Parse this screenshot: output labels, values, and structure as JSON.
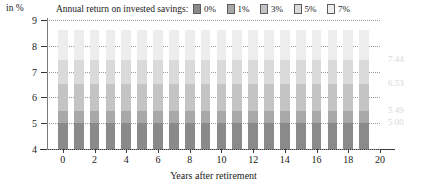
{
  "chart_data": {
    "type": "bar",
    "stacked": true,
    "title": "",
    "xlabel": "Years after retirement",
    "ylabel": "in %",
    "xlim": [
      -1,
      20
    ],
    "ylim": [
      4,
      9
    ],
    "grid": true,
    "legend_position": "top",
    "legend_title": "Annual return on invested savings:",
    "xticks": [
      0,
      2,
      4,
      6,
      8,
      10,
      12,
      14,
      16,
      18,
      20
    ],
    "yticks": [
      4,
      5,
      6,
      7,
      8,
      9
    ],
    "categories": [
      0,
      1,
      2,
      3,
      4,
      5,
      6,
      7,
      8,
      9,
      10,
      11,
      12,
      13,
      14,
      15,
      16,
      17,
      18,
      19
    ],
    "series": [
      {
        "name": "0%",
        "color": "#8a8a8a",
        "values": [
          5.0,
          5.0,
          5.0,
          5.0,
          5.0,
          5.0,
          5.0,
          5.0,
          5.0,
          5.0,
          5.0,
          5.0,
          5.0,
          5.0,
          5.0,
          5.0,
          5.0,
          5.0,
          5.0,
          5.0
        ]
      },
      {
        "name": "1%",
        "color": "#a8a8a8",
        "values": [
          5.49,
          5.49,
          5.49,
          5.49,
          5.49,
          5.49,
          5.49,
          5.49,
          5.49,
          5.49,
          5.49,
          5.49,
          5.49,
          5.49,
          5.49,
          5.49,
          5.49,
          5.49,
          5.49,
          5.49
        ]
      },
      {
        "name": "3%",
        "color": "#c4c4c4",
        "values": [
          6.53,
          6.53,
          6.53,
          6.53,
          6.53,
          6.53,
          6.53,
          6.53,
          6.53,
          6.53,
          6.53,
          6.53,
          6.53,
          6.53,
          6.53,
          6.53,
          6.53,
          6.53,
          6.53,
          6.53
        ]
      },
      {
        "name": "5%",
        "color": "#dadada",
        "values": [
          7.44,
          7.44,
          7.44,
          7.44,
          7.44,
          7.44,
          7.44,
          7.44,
          7.44,
          7.44,
          7.44,
          7.44,
          7.44,
          7.44,
          7.44,
          7.44,
          7.44,
          7.44,
          7.44,
          7.44
        ]
      },
      {
        "name": "7%",
        "color": "#ededed",
        "values": [
          8.6,
          8.6,
          8.6,
          8.6,
          8.6,
          8.6,
          8.6,
          8.6,
          8.6,
          8.6,
          8.6,
          8.6,
          8.6,
          8.6,
          8.6,
          8.6,
          8.6,
          8.6,
          8.6,
          8.6
        ]
      }
    ],
    "annotations": [
      {
        "text": "7.44",
        "value": 7.44
      },
      {
        "text": "6.53",
        "value": 6.53
      },
      {
        "text": "5.49",
        "value": 5.49
      },
      {
        "text": "5.00",
        "value": 5.0
      }
    ]
  },
  "legend": {
    "title": "Annual return on invested savings:",
    "items": [
      {
        "label": "0%",
        "color": "#8a8a8a"
      },
      {
        "label": "1%",
        "color": "#a8a8a8"
      },
      {
        "label": "3%",
        "color": "#c4c4c4"
      },
      {
        "label": "5%",
        "color": "#dadada"
      },
      {
        "label": "7%",
        "color": "#ededed"
      }
    ]
  },
  "axes": {
    "y_unit": "in %",
    "x_title": "Years after retirement"
  }
}
